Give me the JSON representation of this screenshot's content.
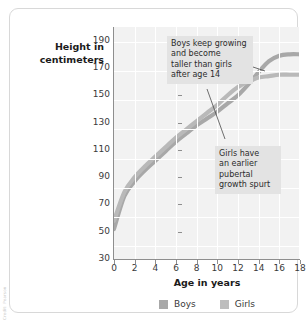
{
  "figure": {
    "attribution": "Credit: Pearson",
    "border_color": "#d8d8d8",
    "plot_background": "#f2f2f2",
    "grid_color": "#ffffff",
    "axis_color": "#8e8e8e"
  },
  "legend": {
    "position": "bottom-center",
    "items": [
      {
        "label": "Boys",
        "color": "#a8a8a8",
        "swatch": "legend-swatch-boys"
      },
      {
        "label": "Girls",
        "color": "#b9b9b9",
        "swatch": "legend-swatch-girls"
      }
    ]
  },
  "annotations": [
    {
      "name": "annotation-boys",
      "text": "Boys keep growing and become taller than girls after age 14",
      "lines": [
        "Boys keep growing",
        "and become",
        "taller than girls",
        "after age 14"
      ],
      "points_to": {
        "x": 15.2,
        "y": 177
      }
    },
    {
      "name": "annotation-girls",
      "text": "Girls have an earlier pubertal growth spurt",
      "lines": [
        "Girls have",
        "an earlier",
        "pubertal",
        "growth spurt"
      ],
      "points_to": {
        "x": 12.1,
        "y": 155
      }
    }
  ],
  "chart_data": {
    "type": "line",
    "title": "",
    "xlabel": "Age in years",
    "ylabel": "Height in centimeters",
    "xlim": [
      0,
      18
    ],
    "ylim": [
      30,
      200
    ],
    "xticks": [
      0,
      2,
      4,
      6,
      8,
      10,
      12,
      14,
      16,
      18
    ],
    "yticks": [
      30,
      50,
      70,
      90,
      110,
      130,
      150,
      170,
      190
    ],
    "grid": true,
    "legend_position": "bottom-center",
    "x": [
      0,
      1,
      2,
      3,
      4,
      5,
      6,
      7,
      8,
      9,
      10,
      11,
      12,
      13,
      14,
      15,
      16,
      17,
      18
    ],
    "series": [
      {
        "name": "Boys",
        "color": "#a8a8a8",
        "values": [
          52,
          76,
          87,
          95,
          102,
          109,
          116,
          122,
          128,
          133,
          138,
          144,
          150,
          158,
          167,
          175,
          179,
          180,
          180
        ]
      },
      {
        "name": "Girls",
        "color": "#b9b9b9",
        "values": [
          58,
          79,
          90,
          98,
          105,
          112,
          119,
          125,
          131,
          137,
          143,
          150,
          156,
          160,
          163,
          164,
          165,
          165,
          165
        ]
      }
    ]
  }
}
